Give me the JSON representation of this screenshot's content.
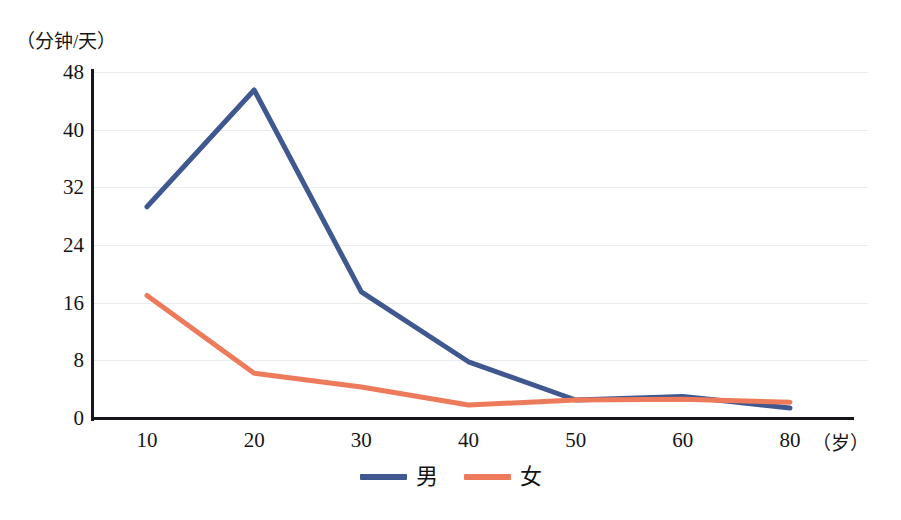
{
  "chart_data": {
    "type": "line",
    "title": "",
    "subtitle": "",
    "ylabel": "（分钟/天）",
    "xlabel": "（岁）",
    "categories": [
      "10",
      "20",
      "30",
      "40",
      "50",
      "60",
      "80"
    ],
    "x_tick_labels": [
      "10",
      "20",
      "30",
      "40",
      "50",
      "60",
      "80"
    ],
    "y_tick_labels": [
      "0",
      "8",
      "16",
      "24",
      "32",
      "40",
      "48"
    ],
    "y_ticks": [
      0,
      8,
      16,
      24,
      32,
      40,
      48
    ],
    "ylim": [
      0,
      48
    ],
    "grid": "horizontal",
    "legend_position": "bottom-center",
    "series": [
      {
        "name": "男",
        "color": "#40588f",
        "values": [
          29.3,
          45.5,
          17.5,
          7.8,
          2.5,
          3.0,
          1.4
        ]
      },
      {
        "name": "女",
        "color": "#ed7a5a",
        "values": [
          17.0,
          6.2,
          4.3,
          1.8,
          2.5,
          2.6,
          2.2
        ]
      }
    ]
  },
  "axis": {
    "y_unit_caption": "（分钟/天）",
    "x_unit_caption": "（岁）"
  },
  "legend": {
    "items": [
      {
        "label": "男",
        "color": "#40588f"
      },
      {
        "label": "女",
        "color": "#ed7a5a"
      }
    ]
  },
  "colors": {
    "male_line": "#40588f",
    "female_line": "#ed7a5a",
    "axis": "#14161a",
    "grid": "#e9ecef",
    "text": "#161616",
    "background": "#ffffff"
  }
}
